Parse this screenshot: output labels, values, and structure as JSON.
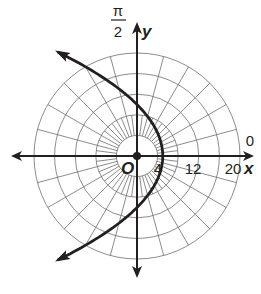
{
  "chart_data": {
    "type": "line",
    "coordinate_system": "polar",
    "title": "",
    "equation_hint": "r = 10 / (1 + cos θ)",
    "curve": {
      "name": "parabola",
      "description": "Parabola opening left, vertex at (5, 0), focus at pole O, crossing y-axis at ±10",
      "points": [
        {
          "x": -16,
          "y": 20
        },
        {
          "x": -7.8,
          "y": 16
        },
        {
          "x": -1.2,
          "y": 11
        },
        {
          "x": 0,
          "y": 10
        },
        {
          "x": 3.2,
          "y": 6
        },
        {
          "x": 5,
          "y": 0
        },
        {
          "x": 3.2,
          "y": -6
        },
        {
          "x": 0,
          "y": -10
        },
        {
          "x": -1.2,
          "y": -11
        },
        {
          "x": -7.8,
          "y": -16
        },
        {
          "x": -16,
          "y": -20
        }
      ],
      "arrows_at_ends": true,
      "color": "#231f20"
    },
    "grid": {
      "circles_r": [
        4,
        8,
        12,
        16,
        20
      ],
      "radial_step_deg": 15,
      "color": "#6d6e71"
    },
    "axes": {
      "x_label": "x",
      "y_label": "y",
      "origin_label": "O",
      "polar_axis_label": "0",
      "pi_over_2_label": {
        "numerator": "π",
        "denominator": "2"
      },
      "x_tick_labels": [
        "4",
        "12",
        "20"
      ],
      "r_max": 20
    },
    "colors": {
      "ink": "#231f20",
      "grid": "#6d6e71",
      "background": "#ffffff"
    }
  }
}
